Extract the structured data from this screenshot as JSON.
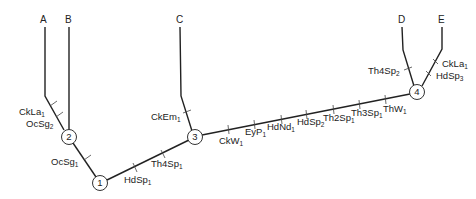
{
  "tree": {
    "tips": [
      {
        "id": "A",
        "label": "A"
      },
      {
        "id": "B",
        "label": "B"
      },
      {
        "id": "C",
        "label": "C"
      },
      {
        "id": "D",
        "label": "D"
      },
      {
        "id": "E",
        "label": "E"
      }
    ],
    "nodes": [
      {
        "id": "1",
        "label": "1"
      },
      {
        "id": "2",
        "label": "2"
      },
      {
        "id": "3",
        "label": "3"
      },
      {
        "id": "4",
        "label": "4"
      }
    ],
    "characters": [
      {
        "name": "CkLa",
        "sub": "1",
        "branch": "A"
      },
      {
        "name": "OcSg",
        "sub": "2",
        "branch": "A"
      },
      {
        "name": "OcSg",
        "sub": "1",
        "branch": "2-1"
      },
      {
        "name": "HdSp",
        "sub": "1",
        "branch": "1-3"
      },
      {
        "name": "Th4Sp",
        "sub": "1",
        "branch": "1-3"
      },
      {
        "name": "CkEm",
        "sub": "1",
        "branch": "C"
      },
      {
        "name": "CkW",
        "sub": "1",
        "branch": "3-4"
      },
      {
        "name": "EyP",
        "sub": "1",
        "branch": "3-4"
      },
      {
        "name": "HdNd",
        "sub": "1",
        "branch": "3-4"
      },
      {
        "name": "HdSp",
        "sub": "2",
        "branch": "3-4"
      },
      {
        "name": "Th2Sp",
        "sub": "1",
        "branch": "3-4"
      },
      {
        "name": "Th3Sp",
        "sub": "1",
        "branch": "3-4"
      },
      {
        "name": "ThW",
        "sub": "1",
        "branch": "3-4"
      },
      {
        "name": "Th4Sp",
        "sub": "2",
        "branch": "D"
      },
      {
        "name": "CkLa",
        "sub": "1",
        "branch": "E"
      },
      {
        "name": "HdSp",
        "sub": "3",
        "branch": "E"
      }
    ]
  }
}
